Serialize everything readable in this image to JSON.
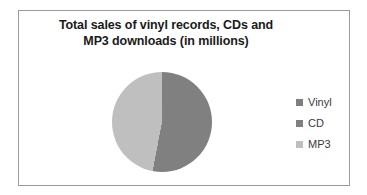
{
  "chart_data": {
    "type": "pie",
    "title": "Total sales of vinyl records, CDs and MP3 downloads (in millions)",
    "title_line_1": "Total sales of vinyl records, CDs and",
    "title_line_2": "MP3 downloads (in millions)",
    "xlabel": "",
    "ylabel": "",
    "categories": [
      "Vinyl",
      "CD",
      "MP3"
    ],
    "values": [
      0.5,
      52.5,
      47
    ],
    "units": "millions",
    "legend_position": "right",
    "grid": false,
    "slices": [
      {
        "label": "Vinyl",
        "value": 0.5,
        "percent": 0.5,
        "color": "#7f7f7f",
        "start_angle": 0,
        "end_angle": 1.8
      },
      {
        "label": "CD",
        "value": 52.5,
        "percent": 52.5,
        "color": "#808080",
        "start_angle": 1.8,
        "end_angle": 190.8
      },
      {
        "label": "MP3",
        "value": 47,
        "percent": 47,
        "color": "#bfbfbf",
        "start_angle": 190.8,
        "end_angle": 360
      }
    ]
  },
  "chart": {
    "background_color": "#ffffff",
    "border_color": "#9a9a9a",
    "title_color": "#1a1a1a",
    "legend_text_color": "#3a3a3a"
  },
  "legend": {
    "items": [
      {
        "label": "Vinyl",
        "color": "#7f7f7f"
      },
      {
        "label": "CD",
        "color": "#808080"
      },
      {
        "label": "MP3",
        "color": "#bfbfbf"
      }
    ]
  }
}
